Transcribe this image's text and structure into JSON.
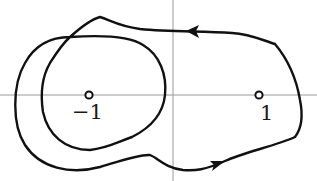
{
  "diagram": {
    "type": "contour-in-complex-plane",
    "axes": {
      "horizontal": true,
      "vertical": true,
      "color": "#9a9a9a"
    },
    "points": [
      {
        "label": "−1",
        "x": 89,
        "y": 95
      },
      {
        "label": "1",
        "x": 259,
        "y": 95
      }
    ],
    "curve": {
      "color": "#111111",
      "closed": true,
      "arrows": [
        {
          "position": "top",
          "direction": "left"
        },
        {
          "position": "bottom",
          "direction": "right"
        }
      ]
    }
  }
}
